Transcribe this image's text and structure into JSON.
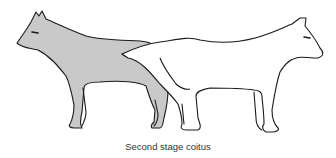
{
  "figure": {
    "caption": "Second stage coitus",
    "subjects": [
      {
        "name": "left-dog",
        "fill": "#c9c9c9",
        "outline": "#1a1a1a",
        "facing": "left"
      },
      {
        "name": "right-dog",
        "fill": "#ffffff",
        "outline": "#1a1a1a",
        "facing": "right"
      }
    ],
    "background": "#ffffff"
  }
}
